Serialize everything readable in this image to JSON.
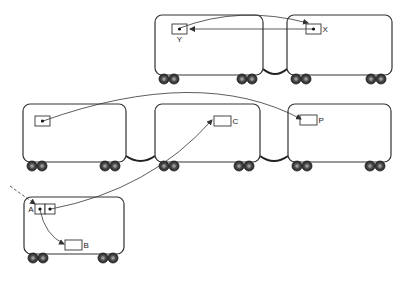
{
  "colors": {
    "stroke": "#333333",
    "fill": "#ffffff",
    "wheel": "#3a3a3a",
    "wheel_hub": "#9a9a9a"
  },
  "cars": [
    {
      "id": "top-left",
      "x": 155,
      "y": 15,
      "w": 108,
      "h": 60
    },
    {
      "id": "top-right",
      "x": 287,
      "y": 15,
      "w": 105,
      "h": 60
    },
    {
      "id": "mid-left",
      "x": 23,
      "y": 104,
      "w": 103,
      "h": 58
    },
    {
      "id": "mid-center",
      "x": 155,
      "y": 104,
      "w": 105,
      "h": 58
    },
    {
      "id": "mid-right",
      "x": 288,
      "y": 104,
      "w": 103,
      "h": 58
    },
    {
      "id": "bottom",
      "x": 24,
      "y": 197,
      "w": 100,
      "h": 57
    }
  ],
  "couplings": [
    {
      "from": "top-left",
      "to": "top-right"
    },
    {
      "from": "mid-left",
      "to": "mid-center"
    },
    {
      "from": "mid-center",
      "to": "mid-right"
    }
  ],
  "cells": [
    {
      "id": "Y",
      "label": "Y",
      "x": 172,
      "y": 24,
      "w": 15,
      "h": 10,
      "dot": true,
      "label_pos": "below"
    },
    {
      "id": "X",
      "label": "X",
      "x": 306,
      "y": 24,
      "w": 15,
      "h": 10,
      "dot": true,
      "label_pos": "right"
    },
    {
      "id": "mid",
      "label": "",
      "x": 35,
      "y": 116,
      "w": 15,
      "h": 10,
      "dot": true,
      "label_pos": "none"
    },
    {
      "id": "C",
      "label": "C",
      "x": 214,
      "y": 116,
      "w": 17,
      "h": 10,
      "dot": false,
      "label_pos": "right"
    },
    {
      "id": "P",
      "label": "P",
      "x": 300,
      "y": 115,
      "w": 17,
      "h": 10,
      "dot": false,
      "label_pos": "right"
    },
    {
      "id": "A1",
      "label": "A",
      "x": 35,
      "y": 204,
      "w": 10,
      "h": 10,
      "dot": true,
      "label_pos": "left"
    },
    {
      "id": "A2",
      "label": "",
      "x": 45,
      "y": 204,
      "w": 10,
      "h": 10,
      "dot": true,
      "label_pos": "none"
    },
    {
      "id": "B",
      "label": "B",
      "x": 65,
      "y": 240,
      "w": 17,
      "h": 10,
      "dot": false,
      "label_pos": "right"
    }
  ],
  "arrows": [
    {
      "id": "X-to-Y",
      "style": "solid",
      "path": "M 313 29 L 190 29"
    },
    {
      "id": "Y-to-X",
      "style": "solid",
      "path": "M 180 28 Q 240 5 308 23"
    },
    {
      "id": "mid-to-P",
      "style": "solid",
      "path": "M 43 121 Q 200 65 301 119"
    },
    {
      "id": "A2-to-C",
      "style": "solid",
      "path": "M 51 209 Q 150 190 212 120"
    },
    {
      "id": "A1-to-B",
      "style": "solid",
      "path": "M 40 210 Q 45 235 64 244"
    },
    {
      "id": "in-to-A",
      "style": "dashed",
      "path": "M 10 186 L 35 204"
    }
  ],
  "labels": {
    "Y": "Y",
    "X": "X",
    "C": "C",
    "P": "P",
    "A": "A",
    "B": "B"
  }
}
